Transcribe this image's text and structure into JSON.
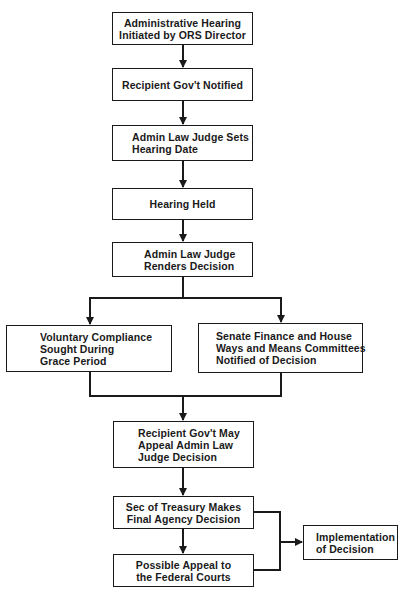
{
  "diagram": {
    "type": "flowchart",
    "colors": {
      "stroke": "#1a1a1a",
      "background": "#ffffff",
      "text": "#1a1a1a"
    },
    "nodes": {
      "n1": {
        "lines": [
          "Administrative Hearing",
          "Initiated by ORS Director"
        ]
      },
      "n2": {
        "lines": [
          "Recipient Gov't Notified"
        ]
      },
      "n3": {
        "lines": [
          "Admin Law Judge Sets",
          "Hearing Date"
        ]
      },
      "n4": {
        "lines": [
          "Hearing Held"
        ]
      },
      "n5": {
        "lines": [
          "Admin Law Judge",
          "Renders Decision"
        ]
      },
      "n6": {
        "lines": [
          "Voluntary Compliance",
          "Sought During",
          "Grace Period"
        ]
      },
      "n7": {
        "lines": [
          "Senate Finance and House",
          "Ways and Means Committees",
          "Notified of Decision"
        ]
      },
      "n8": {
        "lines": [
          "Recipient Gov't May",
          "Appeal Admin Law",
          "Judge Decision"
        ]
      },
      "n9": {
        "lines": [
          "Sec of Treasury Makes",
          "Final Agency Decision"
        ]
      },
      "n10": {
        "lines": [
          "Possible Appeal to",
          "the Federal Courts"
        ]
      },
      "n11": {
        "lines": [
          "Implementation",
          "of Decision"
        ]
      }
    },
    "edges": [
      [
        "n1",
        "n2"
      ],
      [
        "n2",
        "n3"
      ],
      [
        "n3",
        "n4"
      ],
      [
        "n4",
        "n5"
      ],
      [
        "n5",
        "n6"
      ],
      [
        "n5",
        "n7"
      ],
      [
        "n6",
        "n8"
      ],
      [
        "n7",
        "n8"
      ],
      [
        "n8",
        "n9"
      ],
      [
        "n9",
        "n10"
      ],
      [
        "n9",
        "n11"
      ],
      [
        "n10",
        "n11"
      ]
    ]
  }
}
